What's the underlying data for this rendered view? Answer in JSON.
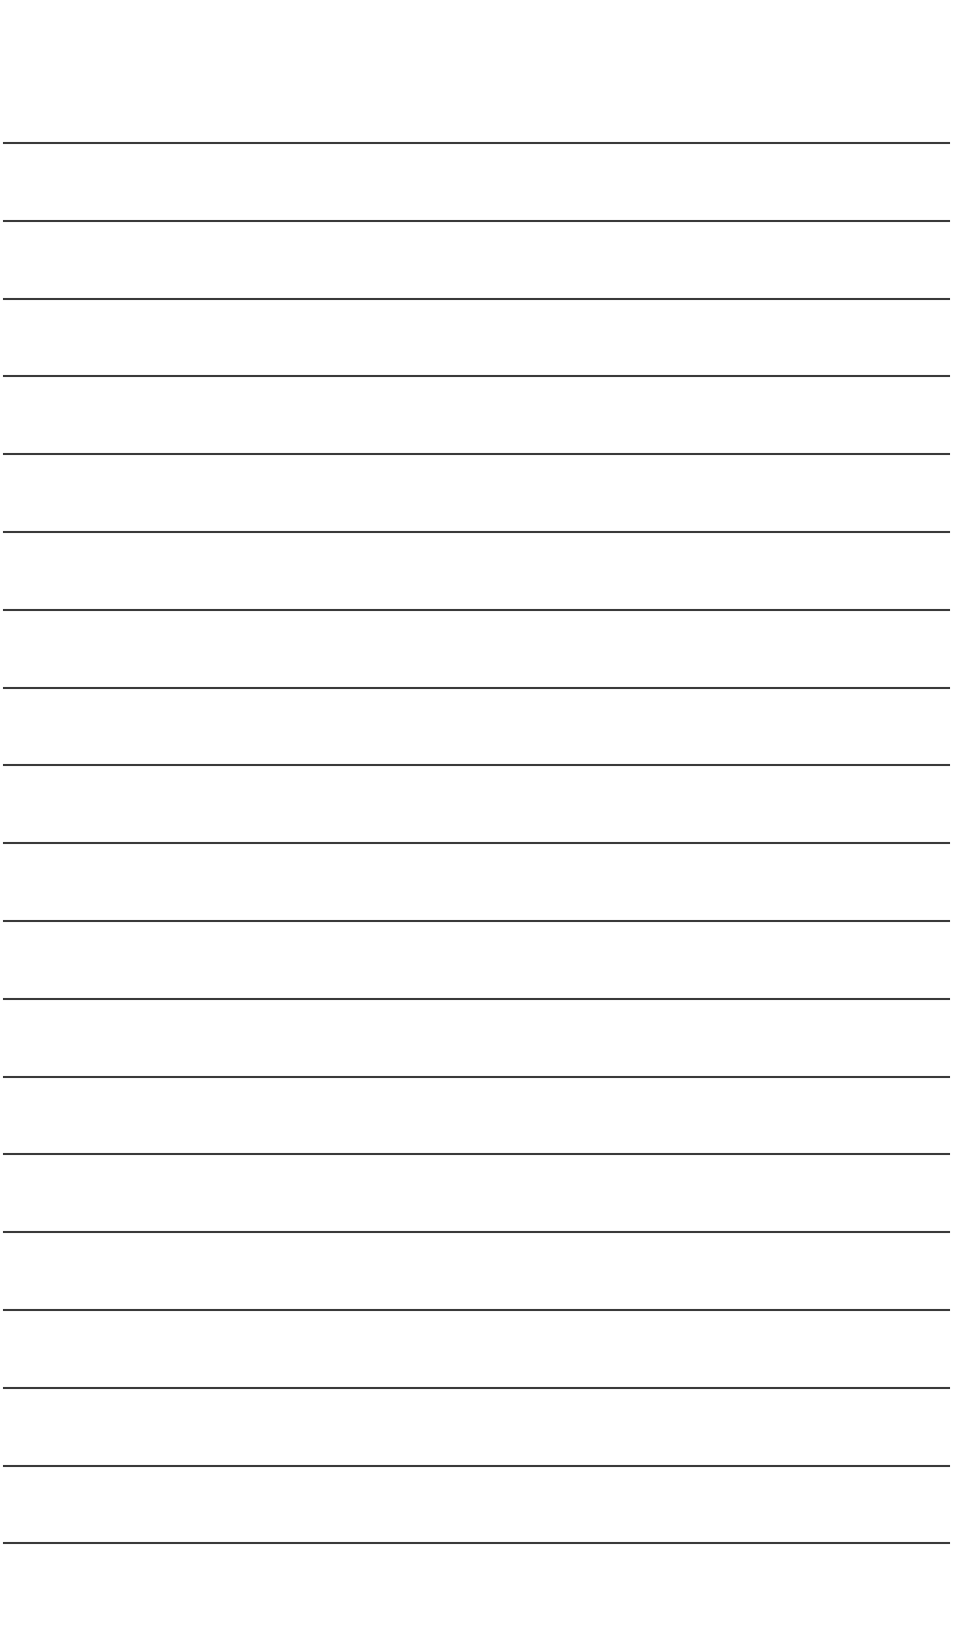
{
  "page": {
    "type": "lined-paper",
    "background_color": "#ffffff",
    "line_color": "#3a3a3a",
    "line_count": 19,
    "first_line_y": 142,
    "line_spacing": 77.8,
    "line_left": 3,
    "line_width": 947
  }
}
